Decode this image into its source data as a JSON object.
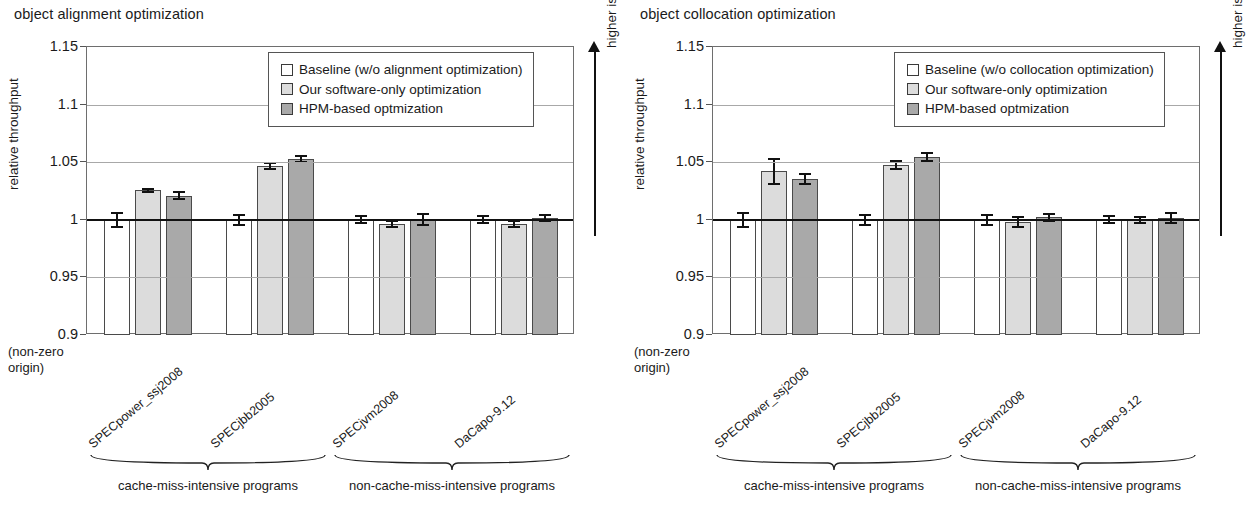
{
  "chart_data": [
    {
      "type": "bar",
      "title": "object alignment optimization",
      "xlabel": "",
      "ylabel": "relative throughput",
      "ylim": [
        0.9,
        1.15
      ],
      "yticks": [
        "0.9",
        "0.95",
        "1",
        "1.05",
        "1.1",
        "1.15"
      ],
      "origin_note_line1": "(non-zero",
      "origin_note_line2": "origin)",
      "direction_note": "higher is faster",
      "grid": true,
      "legend_position": "top-right-inside",
      "categories": [
        "SPECpower_ssj2008",
        "SPECjbb2005",
        "SPECjvm2008",
        "DaCapo-9.12"
      ],
      "series": [
        {
          "name": "Baseline (w/o alignment optimization)",
          "color": "#ffffff",
          "values": [
            1.0,
            1.0,
            1.0,
            1.0
          ],
          "errors": [
            0.007,
            0.005,
            0.004,
            0.004
          ]
        },
        {
          "name": "Our software-only optimization",
          "color": "#dcdcdc",
          "values": [
            1.0255,
            1.0465,
            0.9965,
            0.9965
          ],
          "errors": [
            0.0025,
            0.0035,
            0.0035,
            0.0035
          ]
        },
        {
          "name": "HPM-based optmization",
          "color": "#a9a9a9",
          "values": [
            1.021,
            1.053,
            1.0005,
            1.0015
          ],
          "errors": [
            0.004,
            0.0035,
            0.0055,
            0.0035
          ]
        }
      ],
      "group_braces": [
        {
          "label": "cache-miss-intensive programs",
          "categories": [
            "SPECpower_ssj2008",
            "SPECjbb2005"
          ]
        },
        {
          "label": "non-cache-miss-intensive programs",
          "categories": [
            "SPECjvm2008",
            "DaCapo-9.12"
          ]
        }
      ]
    },
    {
      "type": "bar",
      "title": "object collocation optimization",
      "xlabel": "",
      "ylabel": "relative throughput",
      "ylim": [
        0.9,
        1.15
      ],
      "yticks": [
        "0.9",
        "0.95",
        "1",
        "1.05",
        "1.1",
        "1.15"
      ],
      "origin_note_line1": "(non-zero",
      "origin_note_line2": "origin)",
      "direction_note": "higher is faster",
      "grid": true,
      "legend_position": "top-right-inside",
      "categories": [
        "SPECpower_ssj2008",
        "SPECjbb2005",
        "SPECjvm2008",
        "DaCapo-9.12"
      ],
      "series": [
        {
          "name": "Baseline (w/o collocation optimization)",
          "color": "#ffffff",
          "values": [
            1.0,
            1.0,
            1.0,
            1.0
          ],
          "errors": [
            0.007,
            0.005,
            0.005,
            0.004
          ]
        },
        {
          "name": "Our software-only optimization",
          "color": "#dcdcdc",
          "values": [
            1.042,
            1.0475,
            0.998,
            0.9995
          ],
          "errors": [
            0.0115,
            0.0045,
            0.0055,
            0.0035
          ]
        },
        {
          "name": "HPM-based optmization",
          "color": "#a9a9a9",
          "values": [
            1.0355,
            1.0545,
            1.002,
            1.0015
          ],
          "errors": [
            0.0055,
            0.004,
            0.004,
            0.0055
          ]
        }
      ],
      "group_braces": [
        {
          "label": "cache-miss-intensive programs",
          "categories": [
            "SPECpower_ssj2008",
            "SPECjbb2005"
          ]
        },
        {
          "label": "non-cache-miss-intensive programs",
          "categories": [
            "SPECjvm2008",
            "DaCapo-9.12"
          ]
        }
      ]
    }
  ]
}
